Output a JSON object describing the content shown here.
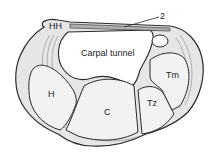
{
  "diagram": {
    "labels": {
      "hamate_hook": "HH",
      "ligament_number": "2",
      "tunnel": "Carpal tunnel",
      "hamate": "H",
      "capitate": "C",
      "trapezoid": "Tz",
      "trapezium": "Tm"
    },
    "colors": {
      "outline": "#2a2a2a",
      "bone_fill": "#f2f2f2",
      "shade": "#9a9a9a",
      "background": "#ffffff"
    }
  }
}
